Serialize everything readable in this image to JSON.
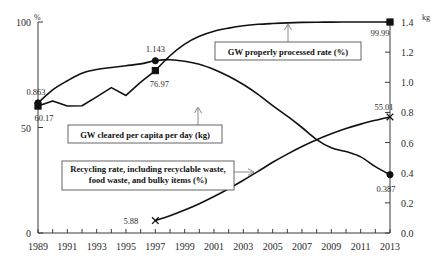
{
  "chart_data": {
    "type": "line",
    "title": "",
    "xlabel": "",
    "ylabel": "%",
    "y2label": "kg",
    "grid": false,
    "legend_position": "inline-callouts",
    "xlim": [
      1989,
      2013
    ],
    "ylim": [
      0,
      100
    ],
    "y2lim": [
      0.0,
      1.4
    ],
    "x": [
      1989,
      1990,
      1991,
      1992,
      1993,
      1994,
      1995,
      1996,
      1997,
      1998,
      1999,
      2000,
      2001,
      2002,
      2003,
      2004,
      2005,
      2006,
      2007,
      2008,
      2009,
      2010,
      2011,
      2012,
      2013
    ],
    "xticks": [
      1989,
      1990,
      1991,
      1992,
      1993,
      1994,
      1995,
      1996,
      1997,
      1998,
      1999,
      2000,
      2001,
      2002,
      2003,
      2004,
      2005,
      2006,
      2007,
      2008,
      2009,
      2010,
      2011,
      2012,
      2013
    ],
    "xtick_labels": [
      "1989",
      "",
      "1991",
      "",
      "1993",
      "",
      "1995",
      "",
      "1997",
      "",
      "1999",
      "",
      "2001",
      "",
      "2003",
      "",
      "2005",
      "",
      "2007",
      "",
      "2009",
      "",
      "2011",
      "",
      "2013"
    ],
    "yticks": [
      0,
      50,
      100
    ],
    "ytick_labels": [
      "0",
      "50",
      "100"
    ],
    "y2ticks": [
      0.0,
      0.2,
      0.4,
      0.6,
      0.8,
      1.0,
      1.2,
      1.4
    ],
    "y2tick_labels": [
      "0.0",
      "0.2",
      "0.4",
      "0.6",
      "0.8",
      "1.0",
      "1.2",
      "1.4"
    ],
    "series": [
      {
        "name": "GW cleared per capita per day (kg)",
        "axis": "right",
        "marker": "circle",
        "values": [
          0.863,
          0.95,
          1.01,
          1.06,
          1.085,
          1.098,
          1.11,
          1.122,
          1.143,
          1.15,
          1.14,
          1.12,
          1.085,
          1.04,
          0.985,
          0.92,
          0.845,
          0.775,
          0.7,
          0.62,
          0.565,
          0.54,
          0.505,
          0.44,
          0.387
        ],
        "endpoint_labels": [
          {
            "x": 1989,
            "value": "0.863"
          },
          {
            "x": 1997,
            "value": "1.143"
          },
          {
            "x": 2013,
            "value": "0.387"
          }
        ]
      },
      {
        "name": "GW properly processed rate (%)",
        "axis": "left",
        "marker": "square",
        "values": [
          60.17,
          62.6,
          60.2,
          60.3,
          64.5,
          68.9,
          65.2,
          71.5,
          76.97,
          84.0,
          89.5,
          93.2,
          95.6,
          97.1,
          98.2,
          98.9,
          99.3,
          99.6,
          99.8,
          99.9,
          99.95,
          99.97,
          99.98,
          99.99,
          99.99
        ],
        "endpoint_labels": [
          {
            "x": 1989,
            "value": "60.17"
          },
          {
            "x": 1997,
            "value": "76.97"
          },
          {
            "x": 2013,
            "value": "99.99"
          }
        ]
      },
      {
        "name": "Recycling rate, including recyclable waste, food waste, and bulky items (%)",
        "axis": "left",
        "marker": "x",
        "values": [
          null,
          null,
          null,
          null,
          null,
          null,
          null,
          null,
          5.88,
          8.2,
          10.9,
          13.9,
          17.3,
          21.0,
          25.0,
          29.2,
          33.5,
          37.4,
          41.0,
          44.2,
          47.0,
          49.5,
          51.6,
          53.4,
          55.01
        ],
        "endpoint_labels": [
          {
            "x": 1997,
            "value": "5.88"
          },
          {
            "x": 2013,
            "value": "55.01"
          }
        ]
      }
    ],
    "callouts": [
      {
        "text_lines": [
          "GW properly processed rate (%)"
        ],
        "target": "processed-rate-line"
      },
      {
        "text_lines": [
          "GW cleared per capita per day (kg)"
        ],
        "target": "per-capita-line"
      },
      {
        "text_lines": [
          "Recycling rate, including recyclable waste,",
          "food waste, and bulky items (%)"
        ],
        "target": "recycling-rate-line"
      }
    ],
    "colors": {
      "line": "#111111",
      "axis": "#3a3a3a",
      "leader": "#8a8a8a",
      "background": "#ffffff",
      "text": "#2b2b2b"
    }
  }
}
